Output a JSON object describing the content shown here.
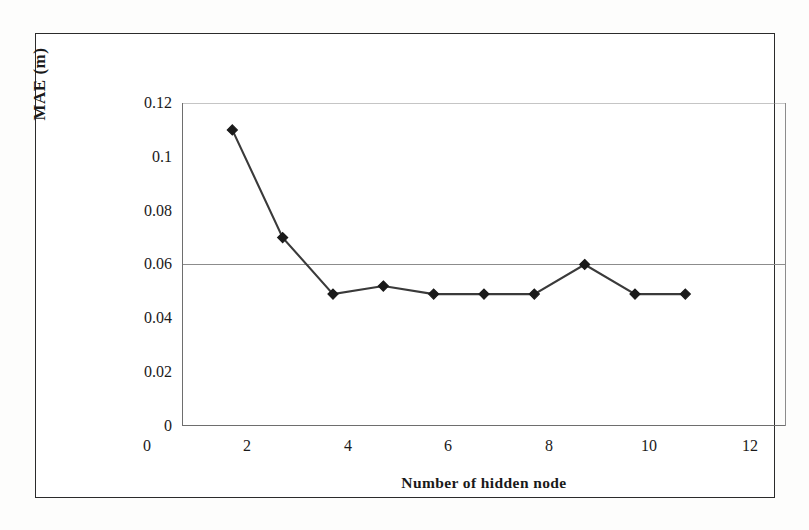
{
  "figure": {
    "frame_color": "#2b2b2b",
    "background_color": "#ffffff"
  },
  "axes": {
    "y_title": "MAE (m)",
    "x_title": "Number of hidden node",
    "y_tick_labels": [
      "0.12",
      "0.1",
      "0.08",
      "0.06",
      "0.04",
      "0.02",
      "0"
    ],
    "x_tick_labels": [
      "0",
      "2",
      "4",
      "6",
      "8",
      "10",
      "12"
    ]
  },
  "chart_data": {
    "type": "line",
    "title": "",
    "subtitle": "",
    "xlabel": "Number of hidden node",
    "ylabel": "MAE (m)",
    "xlim": [
      0,
      12
    ],
    "ylim": [
      0,
      0.12
    ],
    "xticks": [
      0,
      2,
      4,
      6,
      8,
      10,
      12
    ],
    "yticks": [
      0,
      0.02,
      0.04,
      0.06,
      0.08,
      0.1,
      0.12
    ],
    "grid": "horizontal-major-only",
    "gridlines_y": [
      0.06,
      0.12
    ],
    "legend": null,
    "legend_position": "none",
    "marker": "diamond",
    "marker_color": "#1a1a1a",
    "line_color": "#3a3a3a",
    "x": [
      1,
      2,
      3,
      4,
      5,
      6,
      7,
      8,
      9,
      10
    ],
    "values": [
      0.11,
      0.07,
      0.049,
      0.052,
      0.049,
      0.049,
      0.049,
      0.06,
      0.049,
      0.049
    ],
    "series": [
      {
        "name": "MAE",
        "x": [
          1,
          2,
          3,
          4,
          5,
          6,
          7,
          8,
          9,
          10
        ],
        "values": [
          0.11,
          0.07,
          0.049,
          0.052,
          0.049,
          0.049,
          0.049,
          0.06,
          0.049,
          0.049
        ]
      }
    ],
    "annotations": []
  }
}
